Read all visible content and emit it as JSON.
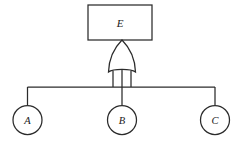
{
  "diagram": {
    "type": "fault-tree",
    "title": "",
    "background_color": "#ffffff",
    "stroke_color": "#2b2b2b",
    "fill_color": "#ffffff",
    "top_event": {
      "label": "E",
      "shape": "rectangle"
    },
    "gate": {
      "label": "",
      "kind": "or-gate",
      "symbol_name": "or-gate-shape"
    },
    "basic_events": [
      {
        "label": "A",
        "shape": "circle"
      },
      {
        "label": "B",
        "shape": "circle"
      },
      {
        "label": "C",
        "shape": "circle"
      }
    ]
  },
  "geometry": {
    "width": 241,
    "height": 145,
    "box": {
      "x": 88,
      "y": 5,
      "w": 64,
      "h": 35
    },
    "gate": {
      "cx": 122,
      "top": 40,
      "bottom": 74,
      "half_width": 14
    },
    "bus": {
      "y": 87,
      "x_left": 27.5,
      "x_right": 215
    },
    "circles": [
      {
        "cx": 27.5,
        "cy": 120,
        "r": 14.5
      },
      {
        "cx": 122,
        "cy": 120,
        "r": 14.5
      },
      {
        "cx": 215,
        "cy": 120,
        "r": 14.5
      }
    ]
  }
}
